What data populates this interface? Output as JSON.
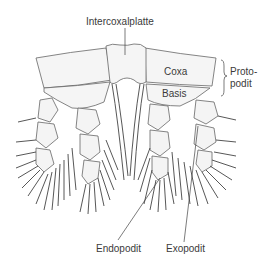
{
  "diagram": {
    "labels": {
      "intercoxalplatte": "Intercoxalplatte",
      "coxa": "Coxa",
      "basis": "Basis",
      "protopodit_line1": "Proto-",
      "protopodit_line2": "podit",
      "endopodit": "Endopodit",
      "exopodit": "Exopodit"
    },
    "colors": {
      "outline": "#555555",
      "fill": "#f4f4f4",
      "setae": "#444444",
      "text": "#3a3a3a"
    }
  }
}
